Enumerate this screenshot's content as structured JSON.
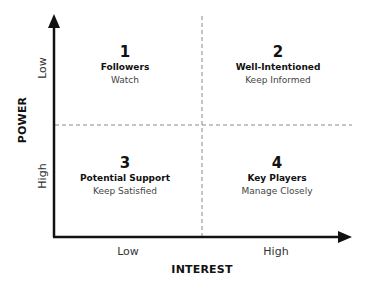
{
  "diagram": {
    "type": "power-interest-grid",
    "x_axis": {
      "title": "INTEREST",
      "low_label": "Low",
      "high_label": "High"
    },
    "y_axis": {
      "title": "POWER",
      "low_label": "Low",
      "high_label": "High"
    },
    "quadrants": [
      {
        "number": "1",
        "title": "Followers",
        "action": "Watch"
      },
      {
        "number": "2",
        "title": "Well-Intentioned",
        "action": "Keep Informed"
      },
      {
        "number": "3",
        "title": "Potential Support",
        "action": "Keep Satisfied"
      },
      {
        "number": "4",
        "title": "Key Players",
        "action": "Manage Closely"
      }
    ],
    "colors": {
      "axis": "#111111",
      "divider": "#888888",
      "text": "#111111",
      "subtext": "#444444"
    }
  }
}
